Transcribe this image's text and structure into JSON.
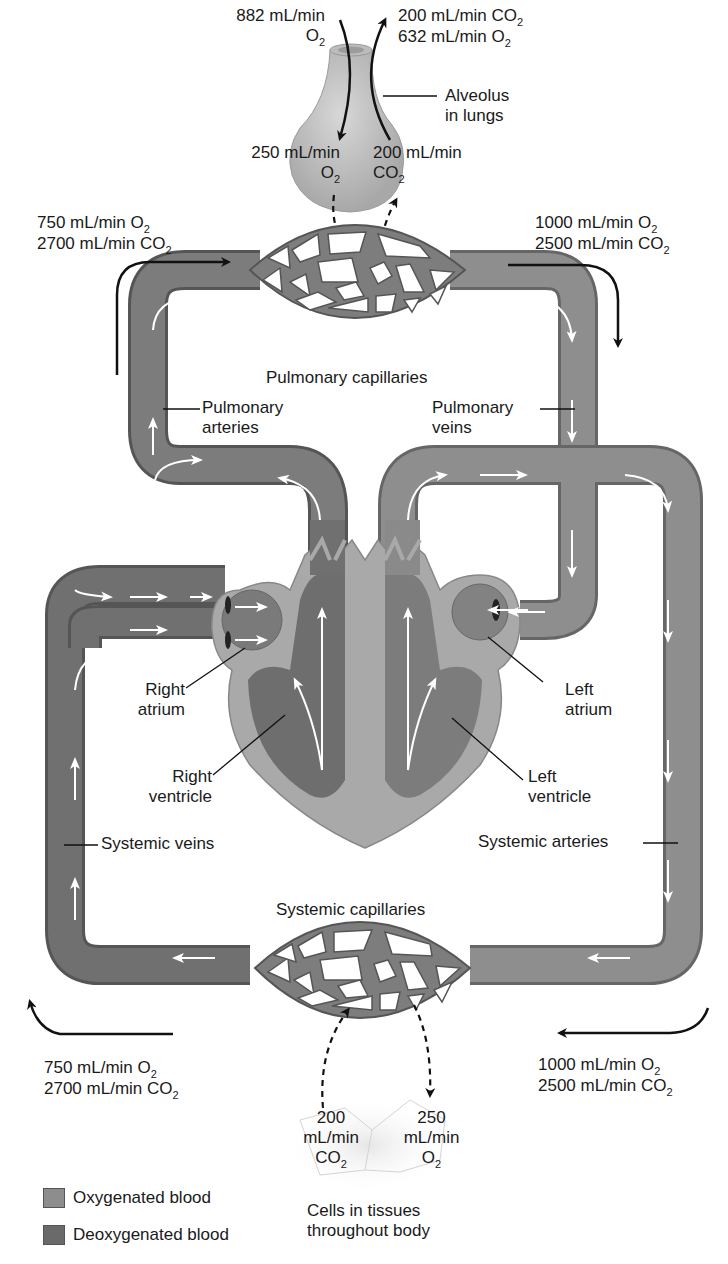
{
  "colors": {
    "oxygenated": "#8d8d8d",
    "deoxygenated": "#6a6a6a",
    "heart_wall": "#a9a9a9",
    "chamber": "#7a7a7a",
    "flow_arrow": "#ffffff",
    "label_text": "#1a1a1a"
  },
  "alveolus": {
    "label_line1": "Alveolus",
    "label_line2": "in lungs",
    "inhaled_value": "882 mL/min",
    "inhaled_gas": "O",
    "inhaled_sub": "2",
    "exhaled_line1_value": "200 mL/min CO",
    "exhaled_line1_sub": "2",
    "exhaled_line2_value": "632 mL/min O",
    "exhaled_line2_sub": "2",
    "to_blood_value": "250 mL/min",
    "to_blood_gas": "O",
    "to_blood_sub": "2",
    "from_blood_value": "200 mL/min",
    "from_blood_gas": "CO",
    "from_blood_sub": "2"
  },
  "pulmonary": {
    "capillaries_label": "Pulmonary capillaries",
    "arteries_line1": "Pulmonary",
    "arteries_line2": "arteries",
    "veins_line1": "Pulmonary",
    "veins_line2": "veins",
    "inflow_o2": "750 mL/min O",
    "inflow_co2": "2700 mL/min CO",
    "outflow_o2": "1000 mL/min O",
    "outflow_co2": "2500 mL/min CO",
    "sub": "2"
  },
  "heart": {
    "right_atrium_line1": "Right",
    "right_atrium_line2": "atrium",
    "right_ventricle_line1": "Right",
    "right_ventricle_line2": "ventricle",
    "left_atrium_line1": "Left",
    "left_atrium_line2": "atrium",
    "left_ventricle_line1": "Left",
    "left_ventricle_line2": "ventricle"
  },
  "systemic": {
    "veins_label": "Systemic veins",
    "arteries_label": "Systemic arteries",
    "capillaries_label": "Systemic capillaries",
    "return_o2": "750 mL/min O",
    "return_co2": "2700 mL/min CO",
    "supply_o2": "1000 mL/min O",
    "supply_co2": "2500 mL/min CO",
    "sub": "2"
  },
  "tissues": {
    "co2_value": "200",
    "co2_unit": "mL/min",
    "co2_gas": "CO",
    "o2_value": "250",
    "o2_unit": "mL/min",
    "o2_gas": "O",
    "sub": "2",
    "label_line1": "Cells in tissues",
    "label_line2": "throughout body"
  },
  "legend": {
    "items": [
      {
        "label": "Oxygenated blood",
        "color": "#8d8d8d"
      },
      {
        "label": "Deoxygenated blood",
        "color": "#6a6a6a"
      }
    ]
  }
}
